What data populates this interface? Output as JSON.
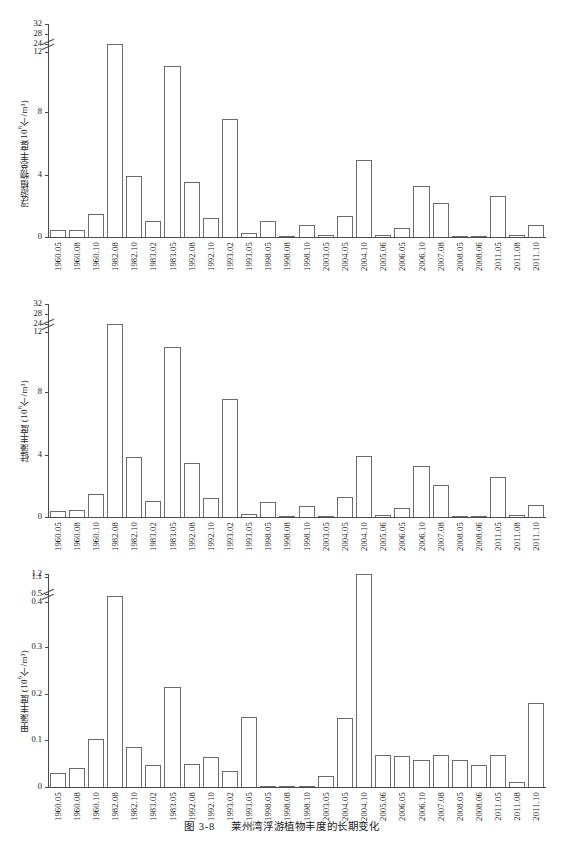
{
  "caption": {
    "figure_number": "图 3-8",
    "text": "莱州湾浮游植物丰度的长期变化"
  },
  "categories": [
    "1960.05",
    "1960.08",
    "1960.10",
    "1982.08",
    "1982.10",
    "1983.02",
    "1983.05",
    "1992.08",
    "1992.10",
    "1993.02",
    "1993.05",
    "1998.05",
    "1998.08",
    "1998.10",
    "2003.05",
    "2004.05",
    "2004.10",
    "2005.06",
    "2006.05",
    "2006.10",
    "2007.08",
    "2008.05",
    "2008.06",
    "2011.05",
    "2011.08",
    "2011.10"
  ],
  "chart_data": [
    {
      "type": "bar",
      "id": "total-phytoplankton",
      "title": "",
      "ylabel": "浮游植物总丰度(10⁶个/m³)",
      "ylabel_main": "浮游植物总丰度(10",
      "ylabel_sup": "6",
      "ylabel_tail": "个/m³)",
      "xlabel": "",
      "grid": false,
      "legend": "none",
      "axis_break": true,
      "lower_ticks": [
        0,
        4,
        8,
        12
      ],
      "upper_ticks": [
        24,
        28,
        32
      ],
      "ytick_labels": [
        "0",
        "4",
        "8",
        "12",
        "24",
        "28",
        "32"
      ],
      "ylim": [
        0,
        32
      ],
      "categories": [
        "1960.05",
        "1960.08",
        "1960.10",
        "1982.08",
        "1982.10",
        "1983.02",
        "1983.05",
        "1992.08",
        "1992.10",
        "1993.02",
        "1993.05",
        "1998.05",
        "1998.08",
        "1998.10",
        "2003.05",
        "2004.05",
        "2004.10",
        "2005.06",
        "2006.05",
        "2006.10",
        "2007.08",
        "2008.05",
        "2008.06",
        "2011.05",
        "2011.08",
        "2011.10"
      ],
      "values": [
        0.42,
        0.45,
        1.5,
        24.2,
        3.9,
        1.0,
        11.0,
        3.5,
        1.2,
        7.6,
        0.25,
        1.0,
        0.05,
        0.75,
        0.1,
        1.35,
        4.95,
        0.15,
        0.6,
        3.3,
        2.15,
        0.03,
        0.05,
        2.6,
        0.1,
        0.8
      ]
    },
    {
      "type": "bar",
      "id": "diatom-abundance",
      "title": "",
      "ylabel": "硅藻丰度 (10⁶个/m³)",
      "ylabel_main": "硅藻丰度 (10",
      "ylabel_sup": "6",
      "ylabel_tail": "个/m³)",
      "xlabel": "",
      "grid": false,
      "legend": "none",
      "axis_break": true,
      "lower_ticks": [
        0,
        4,
        8,
        12
      ],
      "upper_ticks": [
        24,
        28,
        32
      ],
      "ytick_labels": [
        "0",
        "4",
        "8",
        "12",
        "24",
        "28",
        "32"
      ],
      "ylim": [
        0,
        32
      ],
      "categories": [
        "1960.05",
        "1960.08",
        "1960.10",
        "1982.08",
        "1982.10",
        "1983.02",
        "1983.05",
        "1992.08",
        "1992.10",
        "1993.02",
        "1993.05",
        "1998.05",
        "1998.08",
        "1998.10",
        "2003.05",
        "2004.05",
        "2004.10",
        "2005.06",
        "2006.05",
        "2006.10",
        "2007.08",
        "2008.05",
        "2008.06",
        "2011.05",
        "2011.08",
        "2011.10"
      ],
      "values": [
        0.4,
        0.42,
        1.45,
        24.2,
        3.85,
        1.0,
        10.9,
        3.45,
        1.2,
        7.6,
        0.2,
        0.95,
        0.05,
        0.7,
        0.08,
        1.3,
        3.9,
        0.1,
        0.55,
        3.25,
        2.05,
        0.02,
        0.03,
        2.55,
        0.12,
        0.75
      ]
    },
    {
      "type": "bar",
      "id": "dinoflagellate-abundance",
      "title": "",
      "ylabel": "甲藻丰度 (10⁶个/m³)",
      "ylabel_main": "甲藻丰度 (10",
      "ylabel_sup": "6",
      "ylabel_tail": "个/m³)",
      "xlabel": "",
      "grid": false,
      "legend": "none",
      "axis_break": true,
      "lower_ticks": [
        0,
        0.1,
        0.2,
        0.3,
        0.4
      ],
      "upper_ticks": [
        0.5,
        1.1,
        1.2
      ],
      "ytick_labels": [
        "0",
        "0.1",
        "0.2",
        "0.3",
        "0.4",
        "0.5",
        "1.1",
        "1.2"
      ],
      "ylim": [
        0,
        1.2
      ],
      "categories": [
        "1960.05",
        "1960.08",
        "1960.10",
        "1982.08",
        "1982.10",
        "1983.02",
        "1983.05",
        "1992.08",
        "1992.10",
        "1993.02",
        "1993.05",
        "1998.05",
        "1998.08",
        "1998.10",
        "2003.05",
        "2004.05",
        "2004.10",
        "2005.06",
        "2006.05",
        "2006.10",
        "2007.08",
        "2008.05",
        "2008.06",
        "2011.05",
        "2011.08",
        "2011.10"
      ],
      "values": [
        0.03,
        0.04,
        0.103,
        0.425,
        0.086,
        0.046,
        0.213,
        0.05,
        0.065,
        0.035,
        0.15,
        0.003,
        0.002,
        0.003,
        0.024,
        0.147,
        1.185,
        0.068,
        0.066,
        0.058,
        0.068,
        0.057,
        0.046,
        0.068,
        0.01,
        0.18
      ]
    }
  ]
}
